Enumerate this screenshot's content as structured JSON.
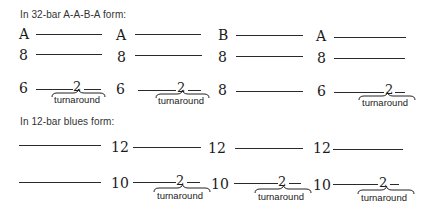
{
  "sections": {
    "aaba": {
      "heading": "In 32-bar A-A-B-A form:",
      "row1": [
        "A",
        "A",
        "B",
        "A"
      ],
      "row2": [
        "8",
        "8",
        "8",
        "8"
      ],
      "row3": [
        "6",
        "6",
        "8",
        "6"
      ],
      "turnaround_number": "2",
      "turnaround_label": "turnaround"
    },
    "blues": {
      "heading": "In 12-bar blues form:",
      "row1": [
        "12",
        "12",
        "12"
      ],
      "row2": [
        "10",
        "10",
        "10"
      ],
      "turnaround_number": "2",
      "turnaround_label": "turnaround"
    }
  }
}
